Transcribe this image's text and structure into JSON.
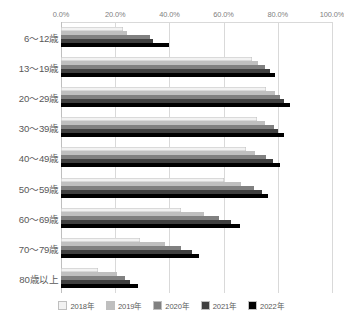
{
  "chart_data": {
    "type": "bar",
    "orientation": "horizontal",
    "title": "",
    "subtitle": "",
    "xlabel": "",
    "ylabel": "",
    "xlim": [
      0,
      100
    ],
    "xticks": [
      0,
      20,
      40,
      60,
      80,
      100
    ],
    "xtick_labels": [
      "0.0%",
      "20.0%",
      "40.0%",
      "60.0%",
      "80.0%",
      "100.0%"
    ],
    "grid": true,
    "legend_position": "bottom",
    "categories": [
      "6〜12歳",
      "13〜19歳",
      "20〜29歳",
      "30〜39歳",
      "40〜49歳",
      "50〜59歳",
      "60〜69歳",
      "70〜79歳",
      "80歳以上"
    ],
    "series": [
      {
        "name": "2018年",
        "color": "#f2f2f2",
        "values": [
          22.9,
          70.6,
          75.7,
          72.5,
          68.1,
          60.1,
          44.2,
          29.0,
          13.7
        ]
      },
      {
        "name": "2019年",
        "color": "#bfbfbf",
        "values": [
          24.4,
          72.7,
          78.8,
          75.4,
          71.6,
          66.5,
          52.6,
          38.2,
          20.5
        ]
      },
      {
        "name": "2020年",
        "color": "#808080",
        "values": [
          32.8,
          75.3,
          80.9,
          78.6,
          75.8,
          71.1,
          58.3,
          44.4,
          23.6
        ]
      },
      {
        "name": "2021年",
        "color": "#404040",
        "values": [
          33.9,
          77.0,
          82.4,
          80.2,
          78.1,
          74.0,
          62.7,
          48.3,
          25.5
        ]
      },
      {
        "name": "2022年",
        "color": "#000000",
        "values": [
          40.0,
          78.9,
          84.6,
          82.3,
          80.8,
          76.2,
          66.2,
          50.9,
          28.3
        ]
      }
    ]
  },
  "legend": {
    "items": [
      {
        "label": "2018年",
        "color": "#f2f2f2"
      },
      {
        "label": "2019年",
        "color": "#bfbfbf"
      },
      {
        "label": "2020年",
        "color": "#808080"
      },
      {
        "label": "2021年",
        "color": "#404040"
      },
      {
        "label": "2022年",
        "color": "#000000"
      }
    ]
  },
  "style": {
    "grid_color": "#d9d9d9",
    "text_color": "#595959",
    "tick_color": "#808080",
    "background": "#ffffff"
  }
}
